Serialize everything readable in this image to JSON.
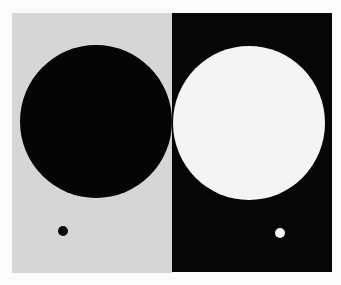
{
  "figure": {
    "background": "#fbfbfb",
    "left_panel": {
      "color": "#d6d6d6",
      "large_circle_color": "#050505",
      "small_dot_color": "#0a0a0a"
    },
    "right_panel": {
      "color": "#060606",
      "large_circle_color": "#f4f4f4",
      "small_dot_color": "#f6f6f6"
    }
  }
}
